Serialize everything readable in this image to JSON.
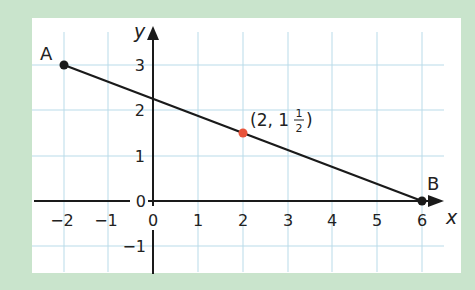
{
  "diagram": {
    "type": "coordinate-line-segment",
    "axes": {
      "x_label": "x",
      "y_label": "y",
      "x_ticks": [
        "−2",
        "−1",
        "0",
        "1",
        "2",
        "3",
        "4",
        "5",
        "6"
      ],
      "y_ticks": [
        "−1",
        "0",
        "1",
        "2",
        "3"
      ],
      "origin_y_label": "0",
      "xlim": [
        -2.5,
        6.5
      ],
      "ylim": [
        -1.5,
        3.5
      ]
    },
    "points": [
      {
        "name": "A",
        "x": -2,
        "y": 3,
        "color": "#1a1a1a"
      },
      {
        "name": "B",
        "x": 6,
        "y": 0,
        "color": "#1a1a1a"
      },
      {
        "name": "midpoint",
        "x": 2,
        "y": 1.5,
        "color": "#e8533a",
        "label": "(2, 1",
        "frac_num": "1",
        "frac_den": "2",
        "label_close": ")"
      }
    ],
    "segment": {
      "from": "A",
      "to": "B",
      "color": "#1a1a1a"
    },
    "colors": {
      "frame": "#c9e4cc",
      "panel": "#ffffff",
      "grid": "#b9dbe9",
      "axis": "#1a1a1a",
      "highlight": "#e8533a"
    }
  }
}
